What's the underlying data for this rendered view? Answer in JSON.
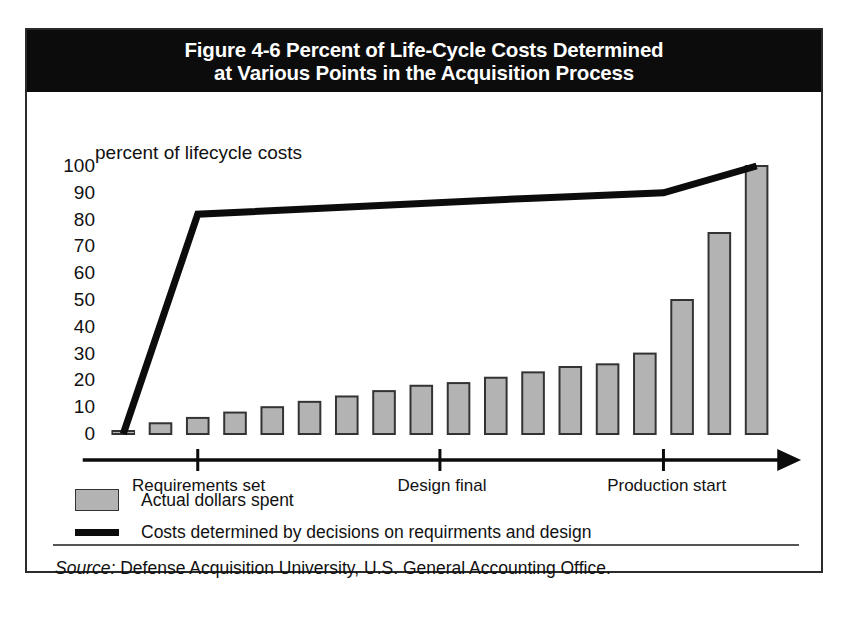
{
  "figure": {
    "title_line1": "Figure 4-6  Percent of Life-Cycle Costs Determined",
    "title_line2": "at Various Points in the Acquisition Process",
    "source_prefix": "Source:",
    "source_text": "Defense Acquisition University, U.S. General Accounting Office."
  },
  "legend": {
    "bars_label": "Actual dollars spent",
    "line_label": "Costs determined by decisions on requirments and design"
  },
  "colors": {
    "title_bar": "#0c0c0c",
    "frame": "#2b2b2b",
    "bar_fill": "#b3b3b3",
    "bar_stroke": "#333333",
    "line": "#0c0c0c",
    "axis": "#0c0c0c",
    "text": "#111111",
    "background": "#ffffff"
  },
  "chart_data": {
    "type": "bar",
    "title": "Figure 4-6  Percent of Life-Cycle Costs Determined at Various Points in the Acquisition Process",
    "xlabel": "",
    "ylabel": "percent of lifecycle costs",
    "ylim": [
      0,
      100
    ],
    "yticks": [
      100,
      90,
      80,
      70,
      60,
      50,
      40,
      30,
      20,
      10,
      0
    ],
    "ytick_labels": [
      "100",
      "90",
      "80",
      "70",
      "60",
      "50",
      "40",
      "30",
      "20",
      "10",
      "0"
    ],
    "y_axis_note": "percent of lifecycle costs",
    "grid": false,
    "legend_position": "below-plot-left",
    "x_category_labels": [
      "Requirements set",
      "Design final",
      "Production start"
    ],
    "x_category_positions": [
      2,
      8.5,
      14.5
    ],
    "n_points": 18,
    "series": [
      {
        "name": "Actual dollars spent",
        "type": "bar",
        "values": [
          1,
          4,
          6,
          8,
          10,
          12,
          14,
          16,
          18,
          19,
          21,
          23,
          25,
          26,
          30,
          50,
          75,
          100
        ]
      },
      {
        "name": "Costs determined by decisions on requirments and design",
        "type": "line",
        "vertices_x": [
          0,
          2,
          11,
          14.5,
          17
        ],
        "vertices_y": [
          0,
          82,
          88,
          90,
          100
        ]
      }
    ]
  }
}
